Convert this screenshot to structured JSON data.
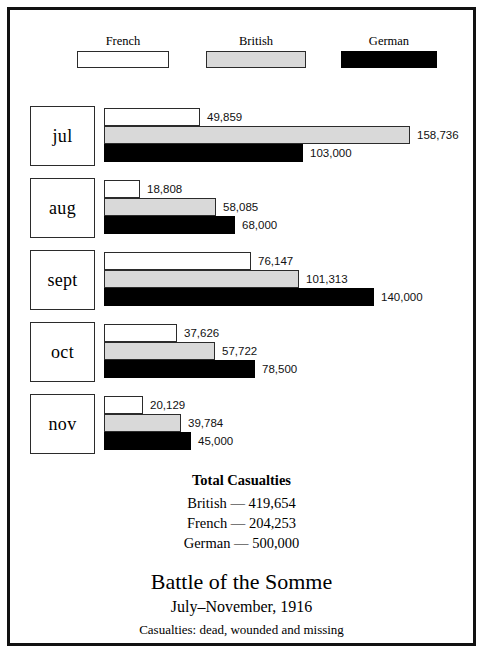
{
  "legend": {
    "items": [
      {
        "label": "French",
        "key": "french",
        "color": "#ffffff",
        "swatch_name": "legend-swatch-french"
      },
      {
        "label": "British",
        "key": "british",
        "color": "#d9d9d9",
        "swatch_name": "legend-swatch-british"
      },
      {
        "label": "German",
        "key": "german",
        "color": "#000000",
        "swatch_name": "legend-swatch-german"
      }
    ]
  },
  "totals": {
    "title": "Total Casualties",
    "lines": [
      "British — 419,654",
      "French — 204,253",
      "German — 500,000"
    ]
  },
  "titleblock": {
    "title": "Battle of the Somme",
    "subtitle": "July–November, 1916",
    "caption": "Casualties: dead, wounded and missing"
  },
  "rows": [
    {
      "month": "jul",
      "bars": [
        {
          "series": "French",
          "value": 49859,
          "label": "49,859"
        },
        {
          "series": "British",
          "value": 158736,
          "label": "158,736"
        },
        {
          "series": "German",
          "value": 103000,
          "label": "103,000"
        }
      ]
    },
    {
      "month": "aug",
      "bars": [
        {
          "series": "French",
          "value": 18808,
          "label": "18,808"
        },
        {
          "series": "British",
          "value": 58085,
          "label": "58,085"
        },
        {
          "series": "German",
          "value": 68000,
          "label": "68,000"
        }
      ]
    },
    {
      "month": "sept",
      "bars": [
        {
          "series": "French",
          "value": 76147,
          "label": "76,147"
        },
        {
          "series": "British",
          "value": 101313,
          "label": "101,313"
        },
        {
          "series": "German",
          "value": 140000,
          "label": "140,000"
        }
      ]
    },
    {
      "month": "oct",
      "bars": [
        {
          "series": "French",
          "value": 37626,
          "label": "37,626"
        },
        {
          "series": "British",
          "value": 57722,
          "label": "57,722"
        },
        {
          "series": "German",
          "value": 78500,
          "label": "78,500"
        }
      ]
    },
    {
      "month": "nov",
      "bars": [
        {
          "series": "French",
          "value": 20129,
          "label": "20,129"
        },
        {
          "series": "British",
          "value": 39784,
          "label": "39,784"
        },
        {
          "series": "German",
          "value": 45000,
          "label": "45,000"
        }
      ]
    }
  ],
  "chart_data": {
    "type": "bar",
    "orientation": "horizontal",
    "title": "Battle of the Somme",
    "subtitle": "July–November, 1916",
    "caption": "Casualties: dead, wounded and missing",
    "xlabel": "",
    "ylabel": "",
    "categories": [
      "jul",
      "aug",
      "sept",
      "oct",
      "nov"
    ],
    "series": [
      {
        "name": "French",
        "color": "#ffffff",
        "values": [
          49859,
          18808,
          76147,
          37626,
          20129
        ]
      },
      {
        "name": "British",
        "color": "#d9d9d9",
        "values": [
          158736,
          58085,
          101313,
          57722,
          39784
        ]
      },
      {
        "name": "German",
        "color": "#000000",
        "values": [
          103000,
          68000,
          140000,
          78500,
          45000
        ]
      }
    ],
    "data_labels": true,
    "grid": false,
    "legend_position": "top",
    "xlim": [
      0,
      158736
    ],
    "px_per_unit": 0.001928,
    "totals": {
      "British": 419654,
      "French": 204253,
      "German": 500000
    }
  }
}
